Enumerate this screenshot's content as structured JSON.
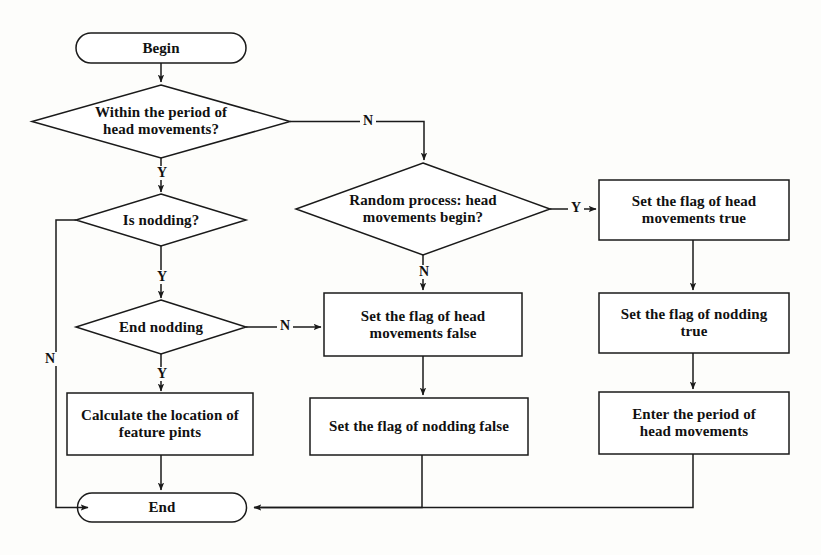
{
  "diagram": {
    "stroke_color": "#1a1a1a",
    "fill_color": "#ffffff",
    "background_color": "#fdfdfb",
    "nodes": [
      {
        "id": "begin",
        "shape": "terminator",
        "text": "Begin"
      },
      {
        "id": "within_period",
        "shape": "decision",
        "line1": "Within the period of",
        "line2": "head movements?"
      },
      {
        "id": "is_nodding",
        "shape": "decision",
        "line1": "Is nodding?",
        "line2": ""
      },
      {
        "id": "end_nodding",
        "shape": "decision",
        "line1": "End nodding",
        "line2": ""
      },
      {
        "id": "calculate",
        "shape": "process",
        "line1": "Calculate the location of",
        "line2": "feature pints"
      },
      {
        "id": "random_process",
        "shape": "decision",
        "line1": "Random process: head",
        "line2": "movements begin?"
      },
      {
        "id": "flag_head_false",
        "shape": "process",
        "line1": "Set the flag of head",
        "line2": "movements false"
      },
      {
        "id": "flag_nod_false",
        "shape": "process",
        "line1": "Set the flag of nodding false",
        "line2": ""
      },
      {
        "id": "flag_head_true",
        "shape": "process",
        "line1": "Set the flag of head",
        "line2": "movements true"
      },
      {
        "id": "flag_nod_true",
        "shape": "process",
        "line1": "Set the flag of nodding",
        "line2": "true"
      },
      {
        "id": "enter_period",
        "shape": "process",
        "line1": "Enter the period of",
        "line2": "head movements"
      },
      {
        "id": "end",
        "shape": "terminator",
        "text": "End"
      }
    ],
    "edge_labels": [
      {
        "id": "within_period_no",
        "text": "N"
      },
      {
        "id": "within_period_yes",
        "text": "Y"
      },
      {
        "id": "is_nodding_no",
        "text": "N"
      },
      {
        "id": "is_nodding_yes",
        "text": "Y"
      },
      {
        "id": "end_nodding_no",
        "text": "N"
      },
      {
        "id": "end_nodding_yes",
        "text": "Y"
      },
      {
        "id": "random_yes",
        "text": "Y"
      },
      {
        "id": "random_no",
        "text": "N"
      }
    ]
  }
}
